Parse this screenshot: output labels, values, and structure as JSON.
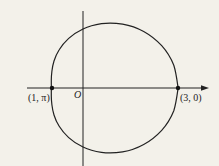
{
  "diagram": {
    "type": "polar-curve",
    "equation_hint": "r = 2 + cos θ",
    "axes": {
      "origin_label": "O",
      "x_axis_arrow": true
    },
    "points": [
      {
        "label": "(1, π)",
        "name": "point-1-pi"
      },
      {
        "label": "(3, 0)",
        "name": "point-3-0"
      }
    ],
    "colors": {
      "background": "#f3f1ea",
      "ink": "#222222"
    }
  }
}
